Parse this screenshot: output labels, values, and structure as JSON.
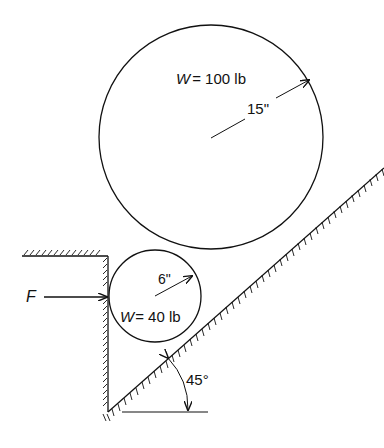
{
  "diagram": {
    "large_cylinder": {
      "weight_label": "W",
      "weight_value": "= 100 lb",
      "radius_label": "15\""
    },
    "small_cylinder": {
      "weight_label": "W",
      "weight_value": "= 40 lb",
      "radius_label": "6\""
    },
    "force": {
      "label": "F"
    },
    "incline": {
      "angle_label": "45°"
    },
    "colors": {
      "stroke": "#111111",
      "background": "#ffffff"
    }
  }
}
